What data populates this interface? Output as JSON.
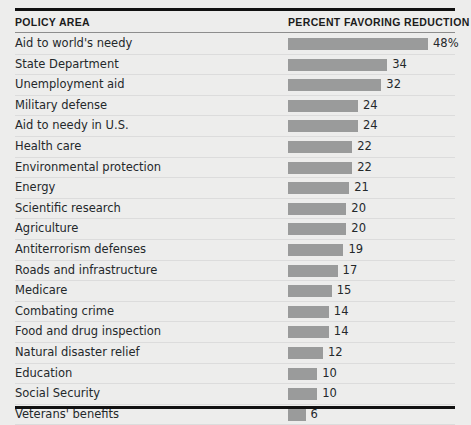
{
  "chart_data": {
    "type": "bar",
    "title": "",
    "orientation": "horizontal",
    "xlabel": "",
    "ylabel": "",
    "grid": false,
    "legend": null,
    "value_suffix_first_row": "%",
    "axis_max": 48,
    "categories": [
      "Aid to world's needy",
      "State Department",
      "Unemployment aid",
      "Military defense",
      "Aid to needy in U.S.",
      "Health care",
      "Environmental protection",
      "Energy",
      "Scientific research",
      "Agriculture",
      "Antiterrorism defenses",
      "Roads and infrastructure",
      "Medicare",
      "Combating crime",
      "Food and drug inspection",
      "Natural disaster relief",
      "Education",
      "Social Security",
      "Veterans' benefits"
    ],
    "values": [
      48,
      34,
      32,
      24,
      24,
      22,
      22,
      21,
      20,
      20,
      19,
      17,
      15,
      14,
      14,
      12,
      10,
      10,
      6
    ],
    "value_labels": [
      "48%",
      "34",
      "32",
      "24",
      "24",
      "22",
      "22",
      "21",
      "20",
      "20",
      "19",
      "17",
      "15",
      "14",
      "14",
      "12",
      "10",
      "10",
      "6"
    ]
  },
  "header": {
    "policy_area": "POLICY AREA",
    "percent_favoring_reduction": "PERCENT FAVORING REDUCTION"
  },
  "colors": {
    "background": "#ededec",
    "bar": "#9a9b9b",
    "rule": "#111111",
    "text": "#24282b",
    "header_text": "#1b1b1b",
    "row_separator": "#dcdcdc"
  }
}
